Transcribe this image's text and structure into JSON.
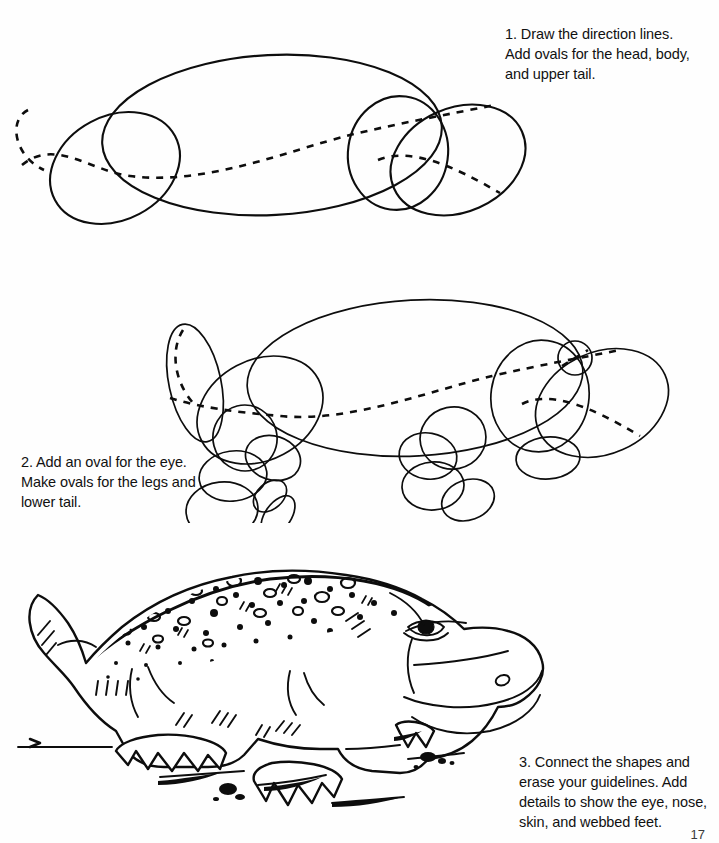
{
  "page": {
    "background_color": "#fefefe",
    "ink_color": "#0d0d0d",
    "page_number": "17"
  },
  "steps": [
    {
      "id": "step-1",
      "number": "1.",
      "text": "1. Draw the direction lines.\nAdd ovals for the head, body,\nand upper tail.",
      "position": "top-right",
      "figure": "construction ovals: large body oval, rear tail oval, head oval, snout oval, dashed direction lines"
    },
    {
      "id": "step-2",
      "number": "2.",
      "text": "2. Add an oval for the eye.\nMake ovals for the legs and\nlower tail.",
      "position": "middle-left",
      "figure": "construction ovals with added eye circle, front and rear leg ovals, foot ovals, lower tail oval"
    },
    {
      "id": "step-3",
      "number": "3.",
      "text": "3. Connect the shapes and\nerase your guidelines. Add\ndetails to show the eye, nose,\nskin, and webbed feet.",
      "position": "bottom-right",
      "figure": "finished alligator line drawing with textured back, eye, nostril, webbed clawed feet and ground shading"
    }
  ]
}
